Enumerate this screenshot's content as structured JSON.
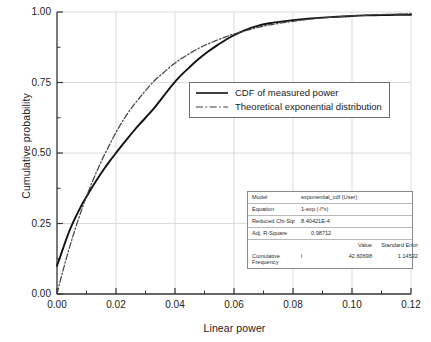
{
  "chart_data": {
    "type": "line",
    "title": "",
    "xlabel": "Linear power",
    "ylabel": "Cumulative probability",
    "xlim": [
      0.0,
      0.12
    ],
    "ylim": [
      0.0,
      1.0
    ],
    "xticks": [
      "0.00",
      "0.02",
      "0.04",
      "0.06",
      "0.08",
      "0.10",
      "0.12"
    ],
    "yticks": [
      "0.00",
      "0.25",
      "0.50",
      "0.75",
      "1.00"
    ],
    "xtick_values": [
      0.0,
      0.02,
      0.04,
      0.06,
      0.08,
      0.1,
      0.12
    ],
    "ytick_values": [
      0.0,
      0.25,
      0.5,
      0.75,
      1.0
    ],
    "grid": true,
    "legend_position": "center",
    "series": [
      {
        "name": "CDF of measured power",
        "style": "solid",
        "color": "#111111",
        "x": [
          0.0,
          0.001,
          0.002,
          0.003,
          0.004,
          0.005,
          0.006,
          0.008,
          0.01,
          0.012,
          0.014,
          0.016,
          0.018,
          0.02,
          0.022,
          0.024,
          0.026,
          0.028,
          0.03,
          0.033,
          0.036,
          0.039,
          0.042,
          0.045,
          0.048,
          0.051,
          0.054,
          0.057,
          0.06,
          0.064,
          0.068,
          0.072,
          0.076,
          0.08,
          0.085,
          0.09,
          0.095,
          0.1,
          0.105,
          0.11,
          0.115,
          0.12
        ],
        "y": [
          0.1,
          0.13,
          0.16,
          0.19,
          0.218,
          0.243,
          0.266,
          0.308,
          0.345,
          0.38,
          0.413,
          0.444,
          0.473,
          0.5,
          0.527,
          0.553,
          0.578,
          0.602,
          0.625,
          0.66,
          0.7,
          0.74,
          0.775,
          0.805,
          0.833,
          0.858,
          0.88,
          0.9,
          0.918,
          0.937,
          0.951,
          0.96,
          0.966,
          0.971,
          0.976,
          0.98,
          0.983,
          0.986,
          0.988,
          0.989,
          0.99,
          0.99
        ]
      },
      {
        "name": "Theoretical exponential distribution",
        "style": "dash-dot",
        "color": "#444444",
        "equation": "1-exp(-42.60698*x)",
        "x": [
          0.0,
          0.001,
          0.002,
          0.003,
          0.004,
          0.005,
          0.006,
          0.008,
          0.01,
          0.012,
          0.014,
          0.016,
          0.018,
          0.02,
          0.022,
          0.024,
          0.026,
          0.028,
          0.03,
          0.033,
          0.036,
          0.039,
          0.042,
          0.045,
          0.048,
          0.051,
          0.054,
          0.057,
          0.06,
          0.064,
          0.068,
          0.072,
          0.076,
          0.08,
          0.085,
          0.09,
          0.095,
          0.1,
          0.105,
          0.11,
          0.115,
          0.12
        ],
        "y": [
          0.0,
          0.042,
          0.082,
          0.12,
          0.157,
          0.191,
          0.225,
          0.288,
          0.346,
          0.399,
          0.447,
          0.492,
          0.533,
          0.573,
          0.609,
          0.641,
          0.67,
          0.696,
          0.721,
          0.756,
          0.784,
          0.811,
          0.834,
          0.853,
          0.871,
          0.886,
          0.899,
          0.911,
          0.922,
          0.934,
          0.945,
          0.954,
          0.961,
          0.967,
          0.974,
          0.979,
          0.983,
          0.986,
          0.989,
          0.991,
          0.992,
          0.994
        ]
      }
    ]
  },
  "legend": {
    "items": [
      {
        "label": "CDF of measured power",
        "style": "solid"
      },
      {
        "label": "Theoretical exponential distribution",
        "style": "dash-dot"
      }
    ]
  },
  "fit_table": {
    "model_label": "Model",
    "model_value": "exponential_cdf (User)",
    "equation_label": "Equation",
    "equation_value": "1-exp (-l*x)",
    "reduced_chisq_label": "Reduced Chi-Sqr",
    "reduced_chisq_value": "8.40421E-4",
    "adj_rsquare_label": "Adj. R-Square",
    "adj_rsquare_value": "0.98712",
    "value_header": "Value",
    "stderr_header": "Standard Error",
    "param_row_label": "Cumulative Frequency",
    "param_symbol": "l",
    "param_value": "42.60698",
    "param_stderr": "1.14532"
  },
  "axes": {
    "x_title": "Linear power",
    "y_title": "Cumulative probability"
  }
}
